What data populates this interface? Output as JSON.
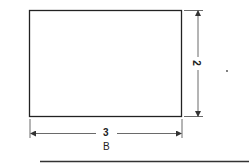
{
  "diagram": {
    "shape": "rectangle",
    "width_label": "3",
    "height_label": "2",
    "caption": "B",
    "stroke_color": "#222222",
    "background": "#ffffff"
  }
}
